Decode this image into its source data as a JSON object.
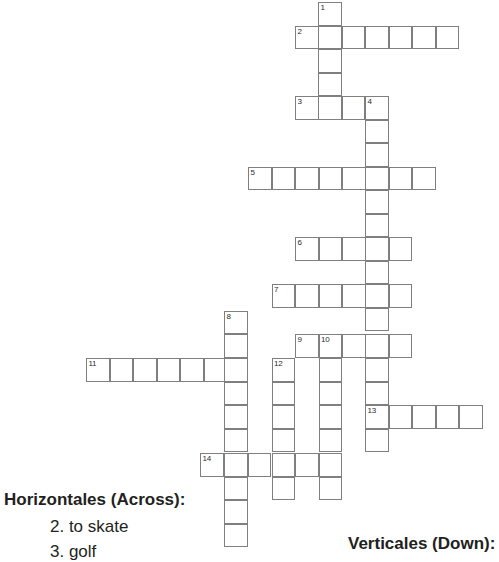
{
  "page": {
    "width": 499,
    "height": 556,
    "background_color": "#ffffff"
  },
  "grid": {
    "cell_size": 23.5,
    "cell_border_color": "#7f7f7f",
    "cell_fill_color": "#ffffff",
    "number_color": "#2b2b2b",
    "entries": [
      {
        "number": "1",
        "direction": "down",
        "length": 5,
        "start_col": 13,
        "start_row": 0
      },
      {
        "number": "2",
        "direction": "across",
        "length": 7,
        "start_col": 12,
        "start_row": 1
      },
      {
        "number": "3",
        "direction": "across",
        "length": 4,
        "start_col": 12,
        "start_row": 4
      },
      {
        "number": "4",
        "direction": "down",
        "length": 16,
        "start_col": 15,
        "start_row": 4
      },
      {
        "number": "5",
        "direction": "across",
        "length": 8,
        "start_col": 10,
        "start_row": 7
      },
      {
        "number": "6",
        "direction": "across",
        "length": 5,
        "start_col": 12,
        "start_row": 10
      },
      {
        "number": "7",
        "direction": "across",
        "length": 6,
        "start_col": 11,
        "start_row": 12
      },
      {
        "number": "8",
        "direction": "down",
        "length": 11,
        "start_col": 9,
        "start_row": 13
      },
      {
        "number": "9",
        "direction": "across",
        "length": 5,
        "start_col": 12,
        "start_row": 14
      },
      {
        "number": "10",
        "direction": "down",
        "length": 8,
        "start_col": 13,
        "start_row": 14
      },
      {
        "number": "11",
        "direction": "across",
        "length": 7,
        "start_col": 3,
        "start_row": 15
      },
      {
        "number": "12",
        "direction": "down",
        "length": 7,
        "start_col": 11,
        "start_row": 15
      },
      {
        "number": "13",
        "direction": "across",
        "length": 5,
        "start_col": 15,
        "start_row": 17
      },
      {
        "number": "14",
        "direction": "across",
        "length": 6,
        "start_col": 8,
        "start_row": 19
      }
    ],
    "cells": [
      {
        "x": 318,
        "y": 2,
        "number": "1"
      },
      {
        "x": 318,
        "y": 25.5
      },
      {
        "x": 295,
        "y": 25.5,
        "number": "2"
      },
      {
        "x": 341.5,
        "y": 25.5
      },
      {
        "x": 365,
        "y": 25.5
      },
      {
        "x": 388.5,
        "y": 25.5
      },
      {
        "x": 412,
        "y": 25.5
      },
      {
        "x": 435.5,
        "y": 25.5
      },
      {
        "x": 318,
        "y": 49
      },
      {
        "x": 318,
        "y": 72.5
      },
      {
        "x": 318,
        "y": 96
      },
      {
        "x": 295,
        "y": 96,
        "number": "3"
      },
      {
        "x": 341.5,
        "y": 96
      },
      {
        "x": 365,
        "y": 96,
        "number": "4"
      },
      {
        "x": 365,
        "y": 119.5
      },
      {
        "x": 365,
        "y": 143
      },
      {
        "x": 248,
        "y": 166.5,
        "number": "5"
      },
      {
        "x": 271.5,
        "y": 166.5
      },
      {
        "x": 295,
        "y": 166.5
      },
      {
        "x": 318.5,
        "y": 166.5
      },
      {
        "x": 342,
        "y": 166.5
      },
      {
        "x": 365,
        "y": 166.5
      },
      {
        "x": 388.5,
        "y": 166.5
      },
      {
        "x": 412,
        "y": 166.5
      },
      {
        "x": 365,
        "y": 190
      },
      {
        "x": 365,
        "y": 213.5
      },
      {
        "x": 295,
        "y": 237,
        "number": "6"
      },
      {
        "x": 318.5,
        "y": 237
      },
      {
        "x": 342,
        "y": 237
      },
      {
        "x": 365,
        "y": 237
      },
      {
        "x": 388.5,
        "y": 237
      },
      {
        "x": 365,
        "y": 260.5
      },
      {
        "x": 271.5,
        "y": 284,
        "number": "7"
      },
      {
        "x": 295,
        "y": 284
      },
      {
        "x": 318.5,
        "y": 284
      },
      {
        "x": 342,
        "y": 284
      },
      {
        "x": 365,
        "y": 284
      },
      {
        "x": 388.5,
        "y": 284
      },
      {
        "x": 224,
        "y": 310.5,
        "number": "8"
      },
      {
        "x": 365,
        "y": 307.5
      },
      {
        "x": 224,
        "y": 334
      },
      {
        "x": 295,
        "y": 334,
        "number": "9"
      },
      {
        "x": 318.5,
        "y": 334,
        "number": "10"
      },
      {
        "x": 342,
        "y": 334
      },
      {
        "x": 365,
        "y": 334
      },
      {
        "x": 388.5,
        "y": 334
      },
      {
        "x": 86,
        "y": 358,
        "number": "11"
      },
      {
        "x": 109.5,
        "y": 358
      },
      {
        "x": 133,
        "y": 358
      },
      {
        "x": 156.5,
        "y": 358
      },
      {
        "x": 180,
        "y": 358
      },
      {
        "x": 203.5,
        "y": 358
      },
      {
        "x": 224,
        "y": 358
      },
      {
        "x": 271.5,
        "y": 358,
        "number": "12"
      },
      {
        "x": 318.5,
        "y": 358
      },
      {
        "x": 365,
        "y": 358
      },
      {
        "x": 224,
        "y": 381.5
      },
      {
        "x": 271.5,
        "y": 381.5
      },
      {
        "x": 318.5,
        "y": 381.5
      },
      {
        "x": 365,
        "y": 381.5
      },
      {
        "x": 224,
        "y": 405
      },
      {
        "x": 271.5,
        "y": 405
      },
      {
        "x": 318.5,
        "y": 405
      },
      {
        "x": 365,
        "y": 405,
        "number": "13"
      },
      {
        "x": 388.5,
        "y": 405
      },
      {
        "x": 412,
        "y": 405
      },
      {
        "x": 435.5,
        "y": 405
      },
      {
        "x": 459,
        "y": 405
      },
      {
        "x": 224,
        "y": 428.5
      },
      {
        "x": 271.5,
        "y": 428.5
      },
      {
        "x": 318.5,
        "y": 428.5
      },
      {
        "x": 365,
        "y": 428.5
      },
      {
        "x": 200,
        "y": 453,
        "number": "14"
      },
      {
        "x": 224,
        "y": 453
      },
      {
        "x": 247.5,
        "y": 453
      },
      {
        "x": 271.5,
        "y": 453
      },
      {
        "x": 295,
        "y": 453
      },
      {
        "x": 318.5,
        "y": 453
      },
      {
        "x": 224,
        "y": 476.5
      },
      {
        "x": 271.5,
        "y": 476.5
      },
      {
        "x": 318.5,
        "y": 476.5
      },
      {
        "x": 224,
        "y": 500
      },
      {
        "x": 224,
        "y": 523.5
      }
    ]
  },
  "clues": {
    "across_heading": "Horizontales (Across):",
    "across_items": [
      "2. to skate",
      "3. golf"
    ],
    "down_heading": "Verticales (Down):"
  }
}
